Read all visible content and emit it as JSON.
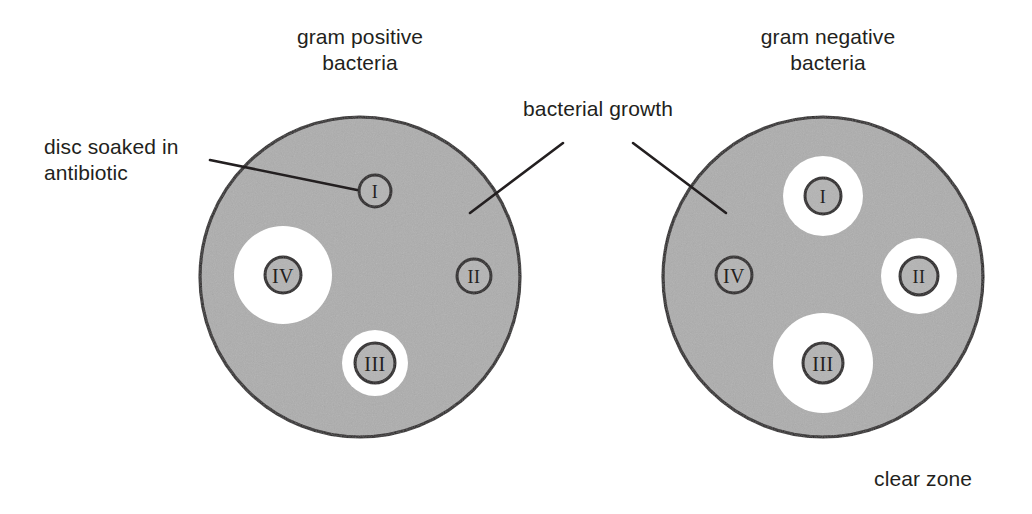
{
  "figure": {
    "background_color": "#ffffff",
    "agar_color": "#adadad",
    "clear_zone_color": "#ffffff",
    "outline_color": "#231f20",
    "disc_fill_color": "#b4b4b4",
    "text_color": "#231f20"
  },
  "labels": {
    "gram_positive": "gram positive\nbacteria",
    "gram_negative": "gram negative\nbacteria",
    "disc_soaked": "disc soaked in\nantibiotic",
    "bacterial_growth": "bacterial growth",
    "clear_zone": "clear zone"
  },
  "plates": [
    {
      "id": "gram-positive",
      "caption": "gram positive bacteria",
      "center": [
        360,
        277
      ],
      "radius": 160,
      "discs": [
        {
          "id": "I",
          "label": "I",
          "center": [
            375,
            191
          ],
          "disc_radius": 16,
          "zone_radius": 0
        },
        {
          "id": "II",
          "label": "II",
          "center": [
            474,
            276
          ],
          "disc_radius": 17,
          "zone_radius": 0
        },
        {
          "id": "III",
          "label": "III",
          "center": [
            375,
            363
          ],
          "disc_radius": 20,
          "zone_radius": 33
        },
        {
          "id": "IV",
          "label": "IV",
          "center": [
            283,
            275
          ],
          "disc_radius": 18,
          "zone_radius": 49
        }
      ]
    },
    {
      "id": "gram-negative",
      "caption": "gram negative bacteria",
      "center": [
        823,
        277
      ],
      "radius": 160,
      "discs": [
        {
          "id": "I",
          "label": "I",
          "center": [
            823,
            196
          ],
          "disc_radius": 18,
          "zone_radius": 40
        },
        {
          "id": "II",
          "label": "II",
          "center": [
            919,
            276
          ],
          "disc_radius": 19,
          "zone_radius": 38
        },
        {
          "id": "III",
          "label": "III",
          "center": [
            823,
            363
          ],
          "disc_radius": 20,
          "zone_radius": 50
        },
        {
          "id": "IV",
          "label": "IV",
          "center": [
            734,
            275
          ],
          "disc_radius": 18,
          "zone_radius": 0
        }
      ]
    }
  ],
  "leader_lines": [
    {
      "id": "disc-soaked-leader",
      "from": [
        210,
        160
      ],
      "to": [
        357,
        190
      ]
    },
    {
      "id": "growth-leader-left",
      "from": [
        563,
        143
      ],
      "to": [
        470,
        213
      ]
    },
    {
      "id": "growth-leader-right",
      "from": [
        633,
        143
      ],
      "to": [
        726,
        213
      ]
    }
  ]
}
